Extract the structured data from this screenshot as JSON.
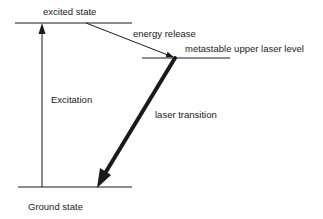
{
  "diagram": {
    "type": "energy-level-diagram",
    "levels": [
      {
        "id": "excited",
        "label": "excited state"
      },
      {
        "id": "metastable",
        "label": "metastable upper laser level"
      },
      {
        "id": "ground",
        "label": "Ground state"
      }
    ],
    "transitions": [
      {
        "from": "ground",
        "to": "excited",
        "label": "Excitation"
      },
      {
        "from": "excited",
        "to": "metastable",
        "label": "energy release"
      },
      {
        "from": "metastable",
        "to": "ground",
        "label": "laser transition"
      }
    ],
    "colors": {
      "line": "#1a1a1a",
      "background": "#ffffff"
    }
  }
}
